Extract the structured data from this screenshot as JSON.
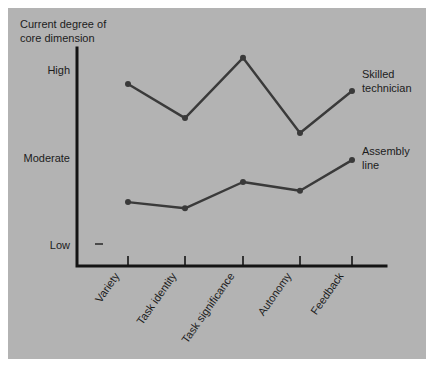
{
  "panel": {
    "background_color": "#b3b3b3",
    "page_background_color": "#ffffff"
  },
  "axis": {
    "y_title_line1": "Current  degree of",
    "y_title_line2": "core dimension",
    "y_ticks": [
      "High",
      "Moderate",
      "Low"
    ],
    "ink_color": "#141414"
  },
  "chart_data": {
    "type": "line",
    "title": "Current  degree of core dimension",
    "xlabel": "",
    "ylabel": "Current degree of core dimension",
    "categories": [
      "Variety",
      "Task identity",
      "Task significance",
      "Autonomy",
      "Feedback"
    ],
    "ytick_labels": [
      "Low",
      "Moderate",
      "High"
    ],
    "ytick_values": [
      1,
      2,
      3
    ],
    "ylim": [
      0.6,
      3.3
    ],
    "grid": false,
    "legend_position": "inline-right",
    "series": [
      {
        "name": "Skilled technician",
        "color": "#3a3a3a",
        "values": [
          2.84,
          2.45,
          3.14,
          2.28,
          2.76
        ]
      },
      {
        "name": "Assembly line",
        "color": "#3a3a3a",
        "values": [
          1.49,
          1.42,
          1.72,
          1.62,
          1.97
        ]
      }
    ],
    "annotations": [
      {
        "text": "Skilled technician",
        "series": "Skilled technician",
        "position": "right-of-last-point"
      },
      {
        "text": "Assembly line",
        "series": "Assembly line",
        "position": "right-of-last-point"
      }
    ]
  },
  "series_labels": {
    "skilled_technician_line1": "Skilled",
    "skilled_technician_line2": "technician",
    "assembly_line_line1": "Assembly",
    "assembly_line_line2": "line"
  }
}
